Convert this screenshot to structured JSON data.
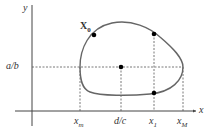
{
  "diagram": {
    "axes": {
      "x_label": "x",
      "y_label": "y"
    },
    "curve": {
      "description": "closed orbit",
      "color": "#666666"
    },
    "points": {
      "start": {
        "label": "X",
        "sub": "0"
      },
      "top_point": {},
      "center_point": {},
      "bottom_point": {}
    },
    "guides": {
      "y_level_label": "a/b"
    },
    "x_ticks": [
      {
        "main": "x",
        "sub": "m"
      },
      {
        "main": "d/c",
        "sub": ""
      },
      {
        "main": "x",
        "sub": "1"
      },
      {
        "main": "x",
        "sub": "M"
      }
    ],
    "colors": {
      "axis": "#444444",
      "curve": "#666666",
      "dash": "#555555",
      "point": "#000000"
    }
  }
}
